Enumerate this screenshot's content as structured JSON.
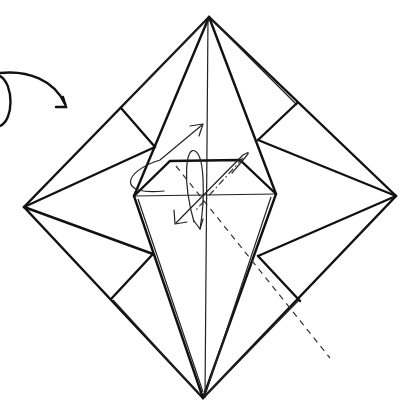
{
  "diagram": {
    "type": "origami-step",
    "description": "Square base folded into a bird base step: inside-reverse folds indicated with arrows",
    "colors": {
      "line": "#111111",
      "background": "#ffffff"
    },
    "elements": [
      "outer-square-rotated",
      "central-kite",
      "hexagon-top-flap",
      "corner-flaps",
      "vertical-center-crease",
      "horizontal-crease",
      "valley-fold-dashed-line",
      "mountain-fold-dash-dot-line",
      "turn-over-arrow",
      "fold-arrows"
    ],
    "arrows": [
      {
        "name": "turn-over-arrow",
        "meaning": "turn model over"
      },
      {
        "name": "fold-up-arrow",
        "meaning": "fold flap up"
      },
      {
        "name": "fold-down-arrow",
        "meaning": "fold flap down"
      }
    ]
  }
}
